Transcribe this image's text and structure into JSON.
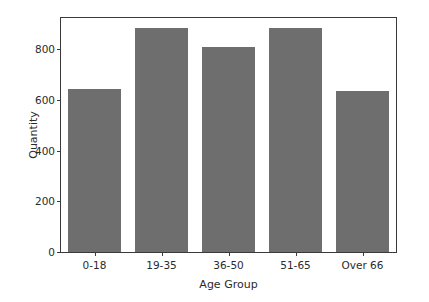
{
  "chart_data": {
    "type": "bar",
    "title": "",
    "xlabel": "Age Group",
    "ylabel": "Quantity",
    "categories": [
      "0-18",
      "19-35",
      "36-50",
      "51-65",
      "Over 66"
    ],
    "values": [
      642,
      884,
      810,
      884,
      634
    ],
    "ylim": [
      0,
      923
    ],
    "xlim": [
      0,
      5
    ],
    "yticks": [
      0,
      200,
      400,
      600,
      800
    ],
    "ytick_labels": [
      "0",
      "200",
      "400",
      "600",
      "800"
    ],
    "grid": false,
    "legend": null,
    "bar_color": "#6e6e6e",
    "axes_color": "#3a3a3a",
    "background_color": "#ffffff",
    "bar_width_ratio": 0.8
  }
}
